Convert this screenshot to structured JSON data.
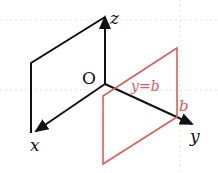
{
  "diagram": {
    "axes": {
      "x_label": "x",
      "y_label": "y",
      "z_label": "z",
      "origin_label": "O"
    },
    "plane_label": "y=b",
    "intercept_label": "b",
    "colors": {
      "axes": "#111111",
      "plane": "#e05a55",
      "grid": "#dddddd"
    }
  }
}
